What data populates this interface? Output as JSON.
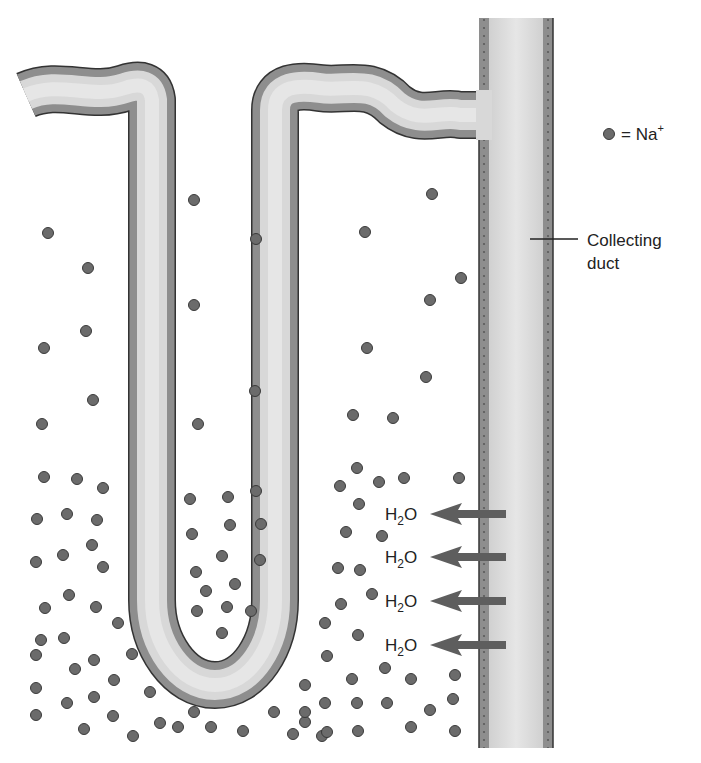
{
  "legend": {
    "symbol_label": "= Na",
    "superscript": "+"
  },
  "duct_label": {
    "line1": "Collecting",
    "line2": "duct"
  },
  "water_labels": [
    {
      "main": "H",
      "sub": "2",
      "tail": "O",
      "y": 514
    },
    {
      "main": "H",
      "sub": "2",
      "tail": "O",
      "y": 557
    },
    {
      "main": "H",
      "sub": "2",
      "tail": "O",
      "y": 601
    },
    {
      "main": "H",
      "sub": "2",
      "tail": "O",
      "y": 645
    }
  ],
  "colors": {
    "dot_fill": "#6b6b6b",
    "dot_stroke": "#3a3a3a",
    "tubule_wall": "#8e8e8e",
    "tubule_lumen": "#d9d9d9",
    "outline": "#333333",
    "arrow": "#5e5e5e"
  },
  "sodium_dots": [
    [
      194,
      200
    ],
    [
      48,
      233
    ],
    [
      256,
      239
    ],
    [
      365,
      232
    ],
    [
      432,
      194
    ],
    [
      88,
      268
    ],
    [
      461,
      278
    ],
    [
      194,
      305
    ],
    [
      430,
      300
    ],
    [
      86,
      331
    ],
    [
      44,
      348
    ],
    [
      367,
      348
    ],
    [
      255,
      391
    ],
    [
      426,
      377
    ],
    [
      93,
      400
    ],
    [
      42,
      424
    ],
    [
      198,
      424
    ],
    [
      353,
      415
    ],
    [
      393,
      418
    ],
    [
      44,
      477
    ],
    [
      77,
      479
    ],
    [
      103,
      488
    ],
    [
      37,
      519
    ],
    [
      67,
      514
    ],
    [
      97,
      520
    ],
    [
      92,
      545
    ],
    [
      36,
      562
    ],
    [
      63,
      555
    ],
    [
      103,
      567
    ],
    [
      45,
      608
    ],
    [
      69,
      595
    ],
    [
      96,
      607
    ],
    [
      41,
      640
    ],
    [
      64,
      638
    ],
    [
      118,
      623
    ],
    [
      36,
      655
    ],
    [
      75,
      669
    ],
    [
      94,
      660
    ],
    [
      132,
      654
    ],
    [
      36,
      688
    ],
    [
      67,
      703
    ],
    [
      94,
      697
    ],
    [
      114,
      680
    ],
    [
      150,
      692
    ],
    [
      36,
      715
    ],
    [
      84,
      729
    ],
    [
      113,
      716
    ],
    [
      133,
      736
    ],
    [
      160,
      723
    ],
    [
      190,
      499
    ],
    [
      228,
      497
    ],
    [
      256,
      491
    ],
    [
      192,
      534
    ],
    [
      230,
      525
    ],
    [
      261,
      524
    ],
    [
      222,
      556
    ],
    [
      260,
      560
    ],
    [
      196,
      572
    ],
    [
      235,
      584
    ],
    [
      206,
      591
    ],
    [
      197,
      611
    ],
    [
      227,
      607
    ],
    [
      251,
      611
    ],
    [
      222,
      633
    ],
    [
      178,
      727
    ],
    [
      211,
      727
    ],
    [
      194,
      712
    ],
    [
      243,
      731
    ],
    [
      274,
      712
    ],
    [
      293,
      734
    ],
    [
      305,
      722
    ],
    [
      322,
      736
    ],
    [
      357,
      468
    ],
    [
      340,
      486
    ],
    [
      379,
      482
    ],
    [
      404,
      478
    ],
    [
      459,
      478
    ],
    [
      359,
      504
    ],
    [
      346,
      532
    ],
    [
      382,
      536
    ],
    [
      338,
      568
    ],
    [
      360,
      570
    ],
    [
      372,
      594
    ],
    [
      341,
      604
    ],
    [
      358,
      635
    ],
    [
      325,
      623
    ],
    [
      327,
      656
    ],
    [
      352,
      679
    ],
    [
      385,
      668
    ],
    [
      411,
      679
    ],
    [
      455,
      675
    ],
    [
      305,
      685
    ],
    [
      305,
      712
    ],
    [
      325,
      703
    ],
    [
      357,
      703
    ],
    [
      387,
      703
    ],
    [
      430,
      710
    ],
    [
      453,
      699
    ],
    [
      327,
      732
    ],
    [
      358,
      731
    ],
    [
      411,
      727
    ],
    [
      455,
      731
    ]
  ]
}
